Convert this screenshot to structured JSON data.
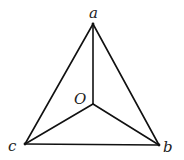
{
  "diagram": {
    "type": "tetrahedron-projection",
    "points": {
      "a": {
        "label": "a",
        "x": 93,
        "y": 24
      },
      "O": {
        "label": "O",
        "x": 93,
        "y": 104
      },
      "b": {
        "label": "b",
        "x": 159,
        "y": 145
      },
      "c": {
        "label": "c",
        "x": 25,
        "y": 144
      }
    },
    "edges": [
      [
        "a",
        "b"
      ],
      [
        "a",
        "c"
      ],
      [
        "b",
        "c"
      ],
      [
        "O",
        "a"
      ],
      [
        "O",
        "b"
      ],
      [
        "O",
        "c"
      ]
    ],
    "labels": {
      "a": "a",
      "O": "O",
      "b": "b",
      "c": "c"
    },
    "colors": {
      "line": "#111111",
      "text": "#222222",
      "background": "#ffffff"
    }
  }
}
